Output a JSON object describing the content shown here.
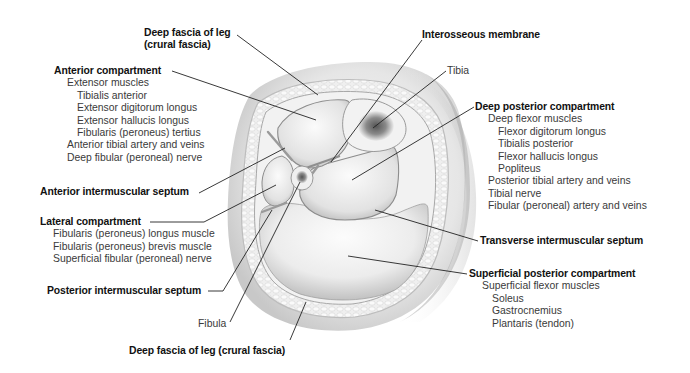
{
  "labels": {
    "deep_fascia_top": {
      "line1": "Deep fascia of leg",
      "line2": "(crural fascia)"
    },
    "anterior_compartment": {
      "title": "Anterior compartment",
      "items": [
        {
          "text": "Extensor muscles",
          "level": 1
        },
        {
          "text": "Tibialis anterior",
          "level": 2
        },
        {
          "text": "Extensor digitorum longus",
          "level": 2
        },
        {
          "text": "Extensor hallucis longus",
          "level": 2
        },
        {
          "text": "Fibularis (peroneus) tertius",
          "level": 2
        },
        {
          "text": "Anterior tibial artery and veins",
          "level": 1
        },
        {
          "text": "Deep fibular (peroneal) nerve",
          "level": 1
        }
      ]
    },
    "anterior_intermuscular_septum": "Anterior intermuscular septum",
    "lateral_compartment": {
      "title": "Lateral compartment",
      "items": [
        {
          "text": "Fibularis (peroneus) longus muscle",
          "level": 1
        },
        {
          "text": "Fibularis (peroneus) brevis muscle",
          "level": 1
        },
        {
          "text": "Superficial fibular (peroneal) nerve",
          "level": 1
        }
      ]
    },
    "posterior_intermuscular_septum": "Posterior intermuscular septum",
    "fibula": "Fibula",
    "deep_fascia_bottom": "Deep fascia of leg (crural fascia)",
    "interosseous_membrane": "Interosseous membrane",
    "tibia": "Tibia",
    "deep_posterior_compartment": {
      "title": "Deep posterior compartment",
      "items": [
        {
          "text": "Deep flexor muscles",
          "level": 1
        },
        {
          "text": "Flexor digitorum longus",
          "level": 2
        },
        {
          "text": "Tibialis posterior",
          "level": 2
        },
        {
          "text": "Flexor hallucis longus",
          "level": 2
        },
        {
          "text": "Popliteus",
          "level": 2
        },
        {
          "text": "Posterior tibial artery and veins",
          "level": 1
        },
        {
          "text": "Tibial nerve",
          "level": 1
        },
        {
          "text": "Fibular (peroneal) artery and veins",
          "level": 1
        }
      ]
    },
    "transverse_intermuscular_septum": "Transverse intermuscular septum",
    "superficial_posterior_compartment": {
      "title": "Superficial posterior compartment",
      "items": [
        {
          "text": "Superficial flexor muscles",
          "level": 1
        },
        {
          "text": "Soleus",
          "level": 2
        },
        {
          "text": "Gastrocnemius",
          "level": 2
        },
        {
          "text": "Plantaris (tendon)",
          "level": 2
        }
      ]
    }
  },
  "colors": {
    "background": "#ffffff",
    "leader_line": "#222222",
    "tissue_light": "#f4f4f4",
    "tissue_shadow": "#bdbdbd",
    "bone_marrow": "#6e6e6e"
  }
}
